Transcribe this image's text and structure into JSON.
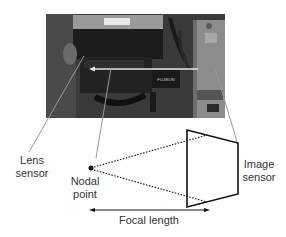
{
  "figure": {
    "photo": {
      "description": "camera with lens mounted",
      "lens_brand_text": "FUJINON"
    },
    "labels": {
      "lens_sensor": [
        "Lens",
        "sensor"
      ],
      "nodal_point": [
        "Nodal",
        "point"
      ],
      "image_sensor": [
        "Image",
        "sensor"
      ],
      "focal_length": "Focal length"
    }
  }
}
